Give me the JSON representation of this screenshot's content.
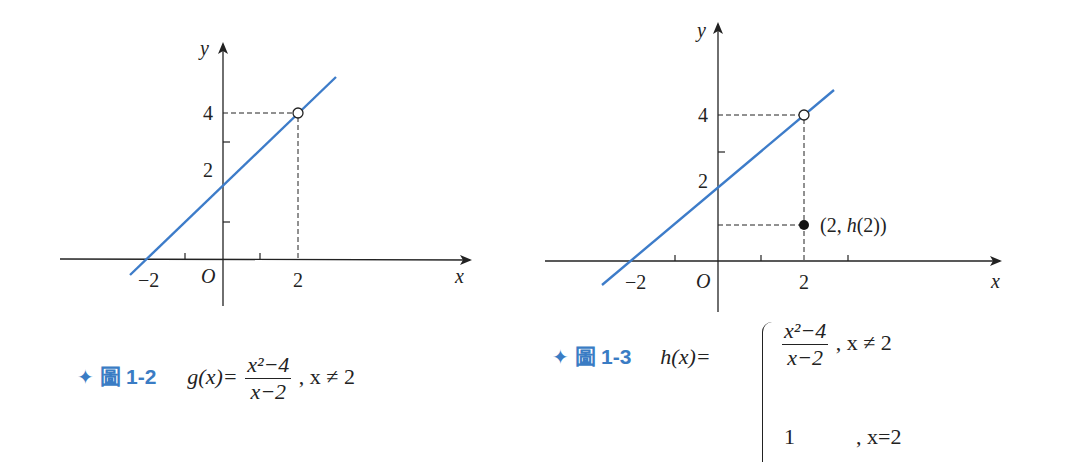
{
  "figures": [
    {
      "id": "fig-1-2",
      "caption": {
        "star": "✦",
        "fig_word": "圖",
        "fig_num": "1-2",
        "lhs": "g(x)=",
        "num": "x²−4",
        "den": "x−2",
        "cond": ",  x ≠ 2"
      },
      "axes": {
        "x_label": "x",
        "y_label": "y",
        "origin": "O",
        "x_ticks": [
          "−2",
          "2"
        ],
        "y_ticks": [
          "2",
          "4"
        ]
      },
      "annotations": {
        "open_point": "(2, 4)"
      }
    },
    {
      "id": "fig-1-3",
      "caption": {
        "star": "✦",
        "fig_word": "圖",
        "fig_num": "1-3",
        "lhs": "h(x)=",
        "num": "x²−4",
        "den": "x−2",
        "cond1": ",  x ≠ 2",
        "val2": "1",
        "cond2": ",  x=2"
      },
      "axes": {
        "x_label": "x",
        "y_label": "y",
        "origin": "O",
        "x_ticks": [
          "−2",
          "2"
        ],
        "y_ticks": [
          "2",
          "4"
        ]
      },
      "annotations": {
        "open_point": "(2, 4)",
        "filled_point_label": "(2, h(2))"
      }
    }
  ],
  "colors": {
    "line": "#3d7cc9",
    "caption_accent": "#3a7cc4",
    "axis": "#222222"
  }
}
